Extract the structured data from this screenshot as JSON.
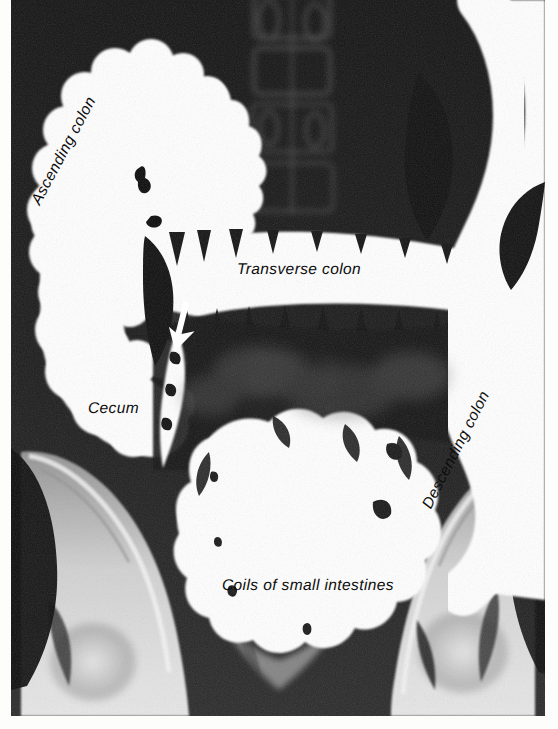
{
  "figure": {
    "type": "radiograph",
    "modality": "barium-enema-x-ray",
    "view": "anteroposterior-abdomen",
    "width_px": 558,
    "height_px": 729,
    "background_color": "#ffffff",
    "plate": {
      "left_px": 11,
      "top_px": 0,
      "width_px": 534,
      "height_px": 716,
      "base_color": "#111111",
      "contrast_color": "#ffffff"
    }
  },
  "annotations": {
    "ascending_colon": {
      "label": "Ascending colon",
      "rotation_deg": -62,
      "x": 36,
      "y": 196
    },
    "transverse_colon": {
      "label": "Transverse colon",
      "rotation_deg": 0,
      "x": 237,
      "y": 262
    },
    "cecum": {
      "label": "Cecum",
      "rotation_deg": 0,
      "x": 88,
      "y": 401
    },
    "descending_colon": {
      "label": "Descending colon",
      "rotation_deg": -63,
      "x": 427,
      "y": 500
    },
    "coils_of_small_intestines": {
      "label": "Coils of small intestines",
      "rotation_deg": 0,
      "x": 222,
      "y": 578
    }
  },
  "markers": {
    "pointer_arrow": {
      "name": "ileocecal-pointer-arrow",
      "color": "#ffffff",
      "direction": "down-left",
      "x": 160,
      "y": 300
    }
  },
  "anatomy_regions": [
    {
      "name": "hepatic-flexure-ascending-colon",
      "fill": "#ffffff"
    },
    {
      "name": "transverse-colon",
      "fill": "#ffffff"
    },
    {
      "name": "descending-colon",
      "fill": "#ffffff"
    },
    {
      "name": "cecum",
      "fill": "#ffffff"
    },
    {
      "name": "small-intestine-coils",
      "fill": "#ffffff"
    },
    {
      "name": "lumbar-vertebrae",
      "fill": "#3a3a3a"
    },
    {
      "name": "iliac-crest-left",
      "fill": "#cfcfcf"
    },
    {
      "name": "iliac-crest-right",
      "fill": "#cfcfcf"
    },
    {
      "name": "femoral-head-left",
      "fill": "#d6d6d6"
    },
    {
      "name": "femoral-head-right",
      "fill": "#d6d6d6"
    },
    {
      "name": "sacrum",
      "fill": "#c8c8c8"
    }
  ]
}
